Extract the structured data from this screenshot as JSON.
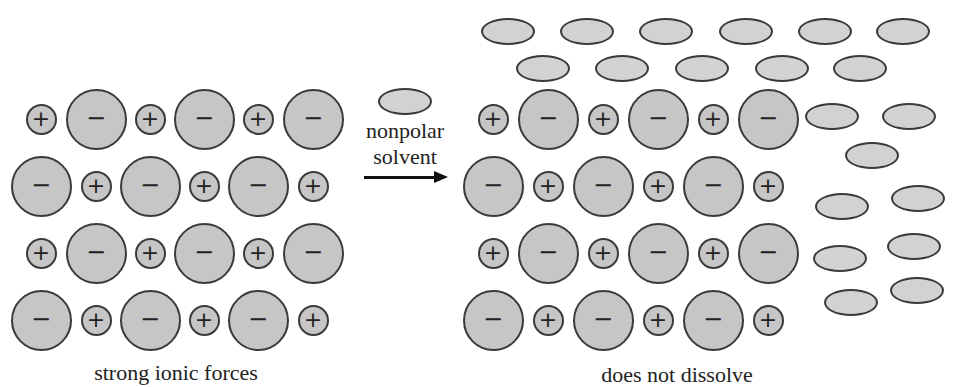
{
  "figure": {
    "left_label": "strong ionic forces",
    "right_label": "does not dissolve",
    "arrow_label_line1": "nonpolar",
    "arrow_label_line2": "solvent",
    "cation_symbol": "+",
    "anion_symbol": "−",
    "colors": {
      "ion_fill": "#c6c6c6",
      "solvent_fill": "#d2d2d2",
      "outline": "#3a3a3a",
      "arrow": "#111111"
    }
  },
  "lattice": {
    "rows_y": [
      119,
      186,
      253,
      320
    ],
    "left_x": [
      41,
      96,
      150,
      204,
      258,
      313
    ],
    "right_x": [
      493,
      548,
      603,
      658,
      713,
      768
    ],
    "row_patterns": [
      [
        "+",
        "-",
        "+",
        "-",
        "+",
        "-"
      ],
      [
        "-",
        "+",
        "-",
        "+",
        "-",
        "+"
      ],
      [
        "+",
        "-",
        "+",
        "-",
        "+",
        "-"
      ],
      [
        "-",
        "+",
        "-",
        "+",
        "-",
        "+"
      ]
    ]
  },
  "solvent_molecules": [
    [
      405,
      101
    ],
    [
      508,
      31
    ],
    [
      587,
      31
    ],
    [
      666,
      31
    ],
    [
      746,
      31
    ],
    [
      825,
      31
    ],
    [
      903,
      31
    ],
    [
      543,
      68
    ],
    [
      622,
      68
    ],
    [
      702,
      68
    ],
    [
      782,
      68
    ],
    [
      860,
      68
    ],
    [
      832,
      116
    ],
    [
      909,
      116
    ],
    [
      872,
      155
    ],
    [
      842,
      206
    ],
    [
      918,
      198
    ],
    [
      840,
      258
    ],
    [
      914,
      246
    ],
    [
      851,
      302
    ],
    [
      917,
      290
    ]
  ]
}
